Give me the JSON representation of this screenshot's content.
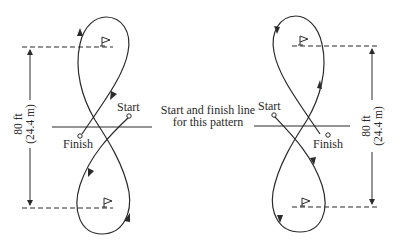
{
  "figure": {
    "center_label": {
      "line1": "Start and finish line",
      "line2": "for this pattern"
    },
    "left_pattern": {
      "start_label": "Start",
      "finish_label": "Finish",
      "dimension": {
        "feet": "80 ft",
        "meters": "(24.4 m)"
      },
      "flags": [
        "top-flag",
        "bottom-flag"
      ]
    },
    "right_pattern": {
      "start_label": "Start",
      "finish_label": "Finish",
      "dimension": {
        "feet": "80 ft",
        "meters": "(24.4 m)"
      },
      "flags": [
        "top-flag",
        "bottom-flag"
      ]
    },
    "colors": {
      "line": "#2a2a2a",
      "background": "#ffffff"
    }
  }
}
